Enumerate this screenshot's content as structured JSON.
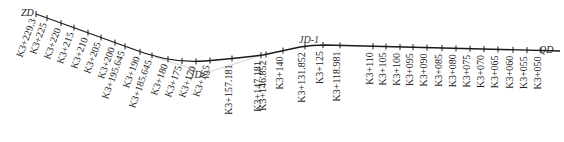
{
  "diagram": {
    "start_label": "ZD",
    "end_label": "QD",
    "intersection_points": [
      {
        "name": "JD-1"
      },
      {
        "name": "JD-2"
      }
    ],
    "stations": [
      {
        "label": "K3+229.3"
      },
      {
        "label": "K3+225"
      },
      {
        "label": "K3+220"
      },
      {
        "label": "K3+215"
      },
      {
        "label": "K3+210"
      },
      {
        "label": "K3+205"
      },
      {
        "label": "K3+200"
      },
      {
        "label": "K3+195.645"
      },
      {
        "label": "K3+190"
      },
      {
        "label": "K3+185.645"
      },
      {
        "label": "K3+180"
      },
      {
        "label": "K3+175"
      },
      {
        "label": "K3+170"
      },
      {
        "label": "K3+165"
      },
      {
        "label": "K3+157.181"
      },
      {
        "label": "K3+147.181"
      },
      {
        "label": "K3+146.852"
      },
      {
        "label": "K3+140"
      },
      {
        "label": "K3+131.852"
      },
      {
        "label": "K3+125"
      },
      {
        "label": "K3+118.981"
      },
      {
        "label": "K3+110"
      },
      {
        "label": "K3+105"
      },
      {
        "label": "K3+100"
      },
      {
        "label": "K3+095"
      },
      {
        "label": "K3+090"
      },
      {
        "label": "K3+085"
      },
      {
        "label": "K3+080"
      },
      {
        "label": "K3+075"
      },
      {
        "label": "K3+070"
      },
      {
        "label": "K3+065"
      },
      {
        "label": "K3+060"
      },
      {
        "label": "K3+055"
      },
      {
        "label": "K3+050"
      }
    ]
  }
}
